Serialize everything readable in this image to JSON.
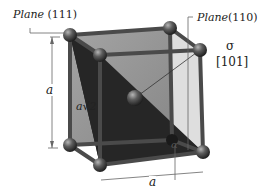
{
  "diagram": {
    "labels": {
      "plane_111": {
        "word": "Plane",
        "index": " (111)"
      },
      "plane_110": {
        "word": "Plane",
        "index": "(110)"
      },
      "sigma": "σ",
      "direction": "[101]",
      "edge_vertical": "a",
      "edge_bottom": "a",
      "diagonal": "a√2",
      "angle": "α"
    },
    "colors": {
      "plane_111": "#1c1c1c",
      "plane_110": "#8a8a8a",
      "bond": "#4a4a4a",
      "atom": "#5a5a5a",
      "dimension_line": "#555555"
    }
  }
}
